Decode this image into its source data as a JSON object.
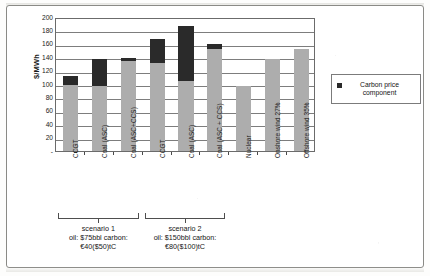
{
  "chart_data": {
    "type": "bar",
    "title": "",
    "subtitle": "",
    "xlabel": "",
    "ylabel": "$/MWh",
    "ylim": [
      0,
      200
    ],
    "ytick_step": 20,
    "yticks": [
      200,
      180,
      160,
      140,
      120,
      100,
      80,
      60,
      40,
      20,
      0
    ],
    "ytick_labels": [
      "200",
      "180",
      "160",
      "140",
      "120",
      "100",
      "80",
      "60",
      "40",
      "20",
      "-"
    ],
    "grid": true,
    "grid_axis": "y",
    "legend_position": "right",
    "stacked": true,
    "categories": [
      "CCGT",
      "Coal (ASC)",
      "Coal (ASC+CCS)",
      "CCGT",
      "Coal (ASC)",
      "Coal (ASC + CCS)",
      "Nuclear",
      "Onshore wind 27%",
      "Offshore wind 35%"
    ],
    "series": [
      {
        "name": "Base cost component",
        "color": "#adadad",
        "values": [
          98,
          97,
          135,
          132,
          105,
          153,
          97,
          137,
          152
        ]
      },
      {
        "name": "Carbon price component",
        "color": "#2a2a2a",
        "values": [
          14,
          40,
          4,
          35,
          81,
          7,
          0,
          0,
          0
        ]
      }
    ],
    "totals": [
      112,
      137,
      139,
      167,
      186,
      160,
      97,
      137,
      152
    ],
    "legend": [
      {
        "label": "Carbon price component",
        "color": "#2a2a2a"
      }
    ],
    "groups": [
      {
        "name": "scenario 1",
        "caption_line1": "scenario 1",
        "caption_line2": "oil: $75bbl carbon:",
        "caption_line3": "€40($50)tC",
        "category_indices": [
          0,
          1,
          2
        ]
      },
      {
        "name": "scenario 2",
        "caption_line1": "scenario 2",
        "caption_line2": "oil: $150bbl carbon:",
        "caption_line3": "€80($100)tC",
        "category_indices": [
          3,
          4,
          5
        ]
      }
    ]
  }
}
